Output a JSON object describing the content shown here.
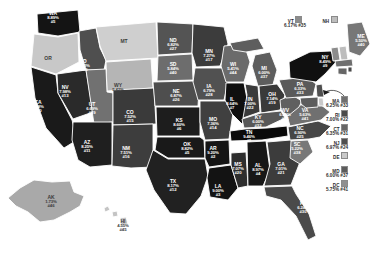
{
  "chart_data": {
    "type": "heatmap",
    "title": "",
    "subtype": "us-state-choropleth",
    "value_unit": "percent",
    "legend_position": "none",
    "grid": false,
    "color_scale": {
      "low": "#d8d8d8",
      "mid": "#7a7a7a",
      "high": "#0d0d0d",
      "note": "darker shade = higher percent"
    },
    "categories": [
      "AL",
      "AK",
      "AZ",
      "AR",
      "CA",
      "CO",
      "CT",
      "DE",
      "DC",
      "FL",
      "GA",
      "HI",
      "ID",
      "IL",
      "IN",
      "IA",
      "KS",
      "KY",
      "LA",
      "ME",
      "MD",
      "MA",
      "MI",
      "MN",
      "MS",
      "MO",
      "MT",
      "NE",
      "NV",
      "NH",
      "NJ",
      "NM",
      "NY",
      "NC",
      "ND",
      "OH",
      "OK",
      "OR",
      "PA",
      "RI",
      "SC",
      "SD",
      "TN",
      "TX",
      "UT",
      "VT",
      "VA",
      "WA",
      "WV",
      "WI",
      "WY"
    ],
    "values": [
      8.97,
      1.73,
      8.25,
      9.2,
      8.48,
      7.52,
      6.35,
      null,
      5.75,
      6.24,
      7.01,
      4.55,
      6.03,
      8.64,
      7.0,
      6.79,
      8.6,
      6.0,
      9.0,
      5.5,
      6.0,
      6.25,
      6.0,
      7.27,
      7.07,
      7.36,
      null,
      6.87,
      7.98,
      null,
      6.97,
      7.51,
      8.49,
      6.9,
      6.82,
      7.14,
      8.82,
      null,
      6.33,
      7.0,
      5.22,
      5.84,
      9.46,
      8.17,
      6.69,
      6.17,
      5.63,
      8.89,
      6.25,
      5.41,
      5.42
    ],
    "ranks": [
      4,
      46,
      11,
      2,
      10,
      15,
      31,
      null,
      41,
      30,
      21,
      45,
      36,
      7,
      22,
      28,
      6,
      32,
      3,
      40,
      37,
      33,
      37,
      17,
      20,
      14,
      null,
      26,
      13,
      null,
      24,
      16,
      9,
      25,
      27,
      19,
      5,
      null,
      33,
      22,
      38,
      40,
      1,
      12,
      29,
      35,
      41,
      5,
      34,
      44,
      43
    ]
  },
  "map": {
    "states": [
      {
        "id": "WA",
        "abbr": "WA",
        "pct": "8.89%",
        "rank": "#5",
        "label_class": "lt",
        "x": 53,
        "y": 17
      },
      {
        "id": "OR",
        "abbr": "OR",
        "pct": "",
        "rank": "",
        "label_class": "dk",
        "x": 48,
        "y": 62
      },
      {
        "id": "CA",
        "abbr": "CA",
        "pct": "8.48%",
        "rank": "#10",
        "label_class": "lt",
        "x": 38,
        "y": 106
      },
      {
        "id": "NV",
        "abbr": "NV",
        "pct": "7.98%",
        "rank": "#13",
        "label_class": "lt",
        "x": 65,
        "y": 91
      },
      {
        "id": "ID",
        "abbr": "ID",
        "pct": "6.03%",
        "rank": "#36",
        "label_class": "lt",
        "x": 84,
        "y": 65
      },
      {
        "id": "MT",
        "abbr": "MT",
        "pct": "",
        "rank": "",
        "label_class": "dk",
        "x": 124,
        "y": 45
      },
      {
        "id": "WY",
        "abbr": "WY",
        "pct": "5.42%",
        "rank": "#43",
        "label_class": "dk",
        "x": 118,
        "y": 89
      },
      {
        "id": "UT",
        "abbr": "UT",
        "pct": "6.69%",
        "rank": "#29",
        "label_class": "lt",
        "x": 92,
        "y": 108
      },
      {
        "id": "AZ",
        "abbr": "AZ",
        "pct": "8.25%",
        "rank": "#11",
        "label_class": "lt",
        "x": 87,
        "y": 146
      },
      {
        "id": "CO",
        "abbr": "CO",
        "pct": "7.52%",
        "rank": "#15",
        "label_class": "lt",
        "x": 130,
        "y": 116
      },
      {
        "id": "NM",
        "abbr": "NM",
        "pct": "7.51%",
        "rank": "#16",
        "label_class": "lt",
        "x": 126,
        "y": 152
      },
      {
        "id": "ND",
        "abbr": "ND",
        "pct": "6.82%",
        "rank": "#27",
        "label_class": "lt",
        "x": 173,
        "y": 44
      },
      {
        "id": "SD",
        "abbr": "SD",
        "pct": "5.84%",
        "rank": "#40",
        "label_class": "lt",
        "x": 173,
        "y": 68
      },
      {
        "id": "NE",
        "abbr": "NE",
        "pct": "6.87%",
        "rank": "#26",
        "label_class": "lt",
        "x": 176,
        "y": 95
      },
      {
        "id": "KS",
        "abbr": "KS",
        "pct": "8.60%",
        "rank": "#6",
        "label_class": "lt",
        "x": 179,
        "y": 124
      },
      {
        "id": "OK",
        "abbr": "OK",
        "pct": "8.82%",
        "rank": "#5",
        "label_class": "lt",
        "x": 187,
        "y": 148
      },
      {
        "id": "TX",
        "abbr": "TX",
        "pct": "8.17%",
        "rank": "#12",
        "label_class": "lt",
        "x": 173,
        "y": 185
      },
      {
        "id": "MN",
        "abbr": "MN",
        "pct": "7.27%",
        "rank": "#17",
        "label_class": "lt",
        "x": 209,
        "y": 55
      },
      {
        "id": "IA",
        "abbr": "IA",
        "pct": "6.79%",
        "rank": "#28",
        "label_class": "lt",
        "x": 209,
        "y": 90
      },
      {
        "id": "MO",
        "abbr": "MO",
        "pct": "7.36%",
        "rank": "#14",
        "label_class": "lt",
        "x": 213,
        "y": 123
      },
      {
        "id": "AR",
        "abbr": "AR",
        "pct": "9.20%",
        "rank": "#2",
        "label_class": "lt",
        "x": 213,
        "y": 152
      },
      {
        "id": "LA",
        "abbr": "LA",
        "pct": "9.00%",
        "rank": "#3",
        "label_class": "lt",
        "x": 218,
        "y": 190
      },
      {
        "id": "WI",
        "abbr": "WI",
        "pct": "5.41%",
        "rank": "#44",
        "label_class": "lt",
        "x": 233,
        "y": 68
      },
      {
        "id": "IL",
        "abbr": "IL",
        "pct": "8.64%",
        "rank": "#7",
        "label_class": "lt",
        "x": 232,
        "y": 103
      },
      {
        "id": "MS",
        "abbr": "MS",
        "pct": "7.07%",
        "rank": "#20",
        "label_class": "lt",
        "x": 238,
        "y": 168
      },
      {
        "id": "MI",
        "abbr": "MI",
        "pct": "6.00%",
        "rank": "#37",
        "label_class": "lt",
        "x": 264,
        "y": 72
      },
      {
        "id": "IN",
        "abbr": "IN",
        "pct": "7.00%",
        "rank": "#22",
        "label_class": "lt",
        "x": 250,
        "y": 103
      },
      {
        "id": "KY",
        "abbr": "KY",
        "pct": "6.00%",
        "rank": "#32",
        "label_class": "lt",
        "x": 258,
        "y": 121
      },
      {
        "id": "TN",
        "abbr": "TN",
        "pct": "9.46%",
        "rank": "#1",
        "label_class": "lt",
        "x": 249,
        "y": 136
      },
      {
        "id": "AL",
        "abbr": "AL",
        "pct": "8.97%",
        "rank": "#4",
        "label_class": "lt",
        "x": 258,
        "y": 169
      },
      {
        "id": "GA",
        "abbr": "GA",
        "pct": "7.01%",
        "rank": "#21",
        "label_class": "lt",
        "x": 281,
        "y": 168
      },
      {
        "id": "FL",
        "abbr": "FL",
        "pct": "6.24%",
        "rank": "#30",
        "label_class": "lt",
        "x": 303,
        "y": 207
      },
      {
        "id": "SC",
        "abbr": "SC",
        "pct": "5.22%",
        "rank": "#38",
        "label_class": "lt",
        "x": 297,
        "y": 148
      },
      {
        "id": "NC",
        "abbr": "NC",
        "pct": "6.90%",
        "rank": "#25",
        "label_class": "lt",
        "x": 300,
        "y": 132
      },
      {
        "id": "OH",
        "abbr": "OH",
        "pct": "7.14%",
        "rank": "#19",
        "label_class": "lt",
        "x": 272,
        "y": 98
      },
      {
        "id": "WV",
        "abbr": "WV",
        "pct": "6.25%",
        "rank": "#34",
        "label_class": "lt",
        "x": 285,
        "y": 114
      },
      {
        "id": "VA",
        "abbr": "VA",
        "pct": "5.63%",
        "rank": "#41",
        "label_class": "lt",
        "x": 305,
        "y": 114
      },
      {
        "id": "PA",
        "abbr": "PA",
        "pct": "6.33%",
        "rank": "#33",
        "label_class": "lt",
        "x": 300,
        "y": 88
      },
      {
        "id": "NY",
        "abbr": "NY",
        "pct": "8.49%",
        "rank": "#9",
        "label_class": "lt",
        "x": 325,
        "y": 61
      },
      {
        "id": "ME",
        "abbr": "ME",
        "pct": "5.50%",
        "rank": "#40",
        "label_class": "lt",
        "x": 361,
        "y": 40
      },
      {
        "id": "AK",
        "abbr": "AK",
        "pct": "1.73%",
        "rank": "#46",
        "label_class": "dk",
        "x": 51,
        "y": 201
      },
      {
        "id": "HI",
        "abbr": "HI",
        "pct": "4.55%",
        "rank": "#45",
        "label_class": "dk",
        "x": 123,
        "y": 225
      }
    ],
    "callouts": [
      {
        "id": "VT",
        "abbr": "VT",
        "pct": "6.17% #35",
        "swatch": "#8c8c8c",
        "x": 295,
        "y": 16
      },
      {
        "id": "NH",
        "abbr": "NH",
        "pct": "",
        "swatch": "#bdbdbd",
        "x": 330,
        "y": 16
      }
    ],
    "side_labels": [
      {
        "id": "MA",
        "abbr": "MA",
        "value": "6.25% #33",
        "swatch": "#6f6f6f",
        "x": 348,
        "y": 96
      },
      {
        "id": "RI",
        "abbr": "RI",
        "value": "7.00% #22",
        "swatch": "#4a4a4a",
        "x": 348,
        "y": 110
      },
      {
        "id": "CT",
        "abbr": "CT",
        "value": "6.35% #31",
        "swatch": "#666666",
        "x": 348,
        "y": 124
      },
      {
        "id": "NJ",
        "abbr": "NJ",
        "value": "6.97% #24",
        "swatch": "#4f4f4f",
        "x": 348,
        "y": 138
      },
      {
        "id": "DE",
        "abbr": "DE",
        "value": "",
        "swatch": "#c9c9c9",
        "x": 348,
        "y": 152
      },
      {
        "id": "MD",
        "abbr": "MD",
        "value": "6.00% #37",
        "swatch": "#5c5c5c",
        "x": 348,
        "y": 166
      },
      {
        "id": "DC",
        "abbr": "DC",
        "value": "5.75% #41",
        "swatch": "#8f8f8f",
        "x": 348,
        "y": 180
      }
    ]
  }
}
